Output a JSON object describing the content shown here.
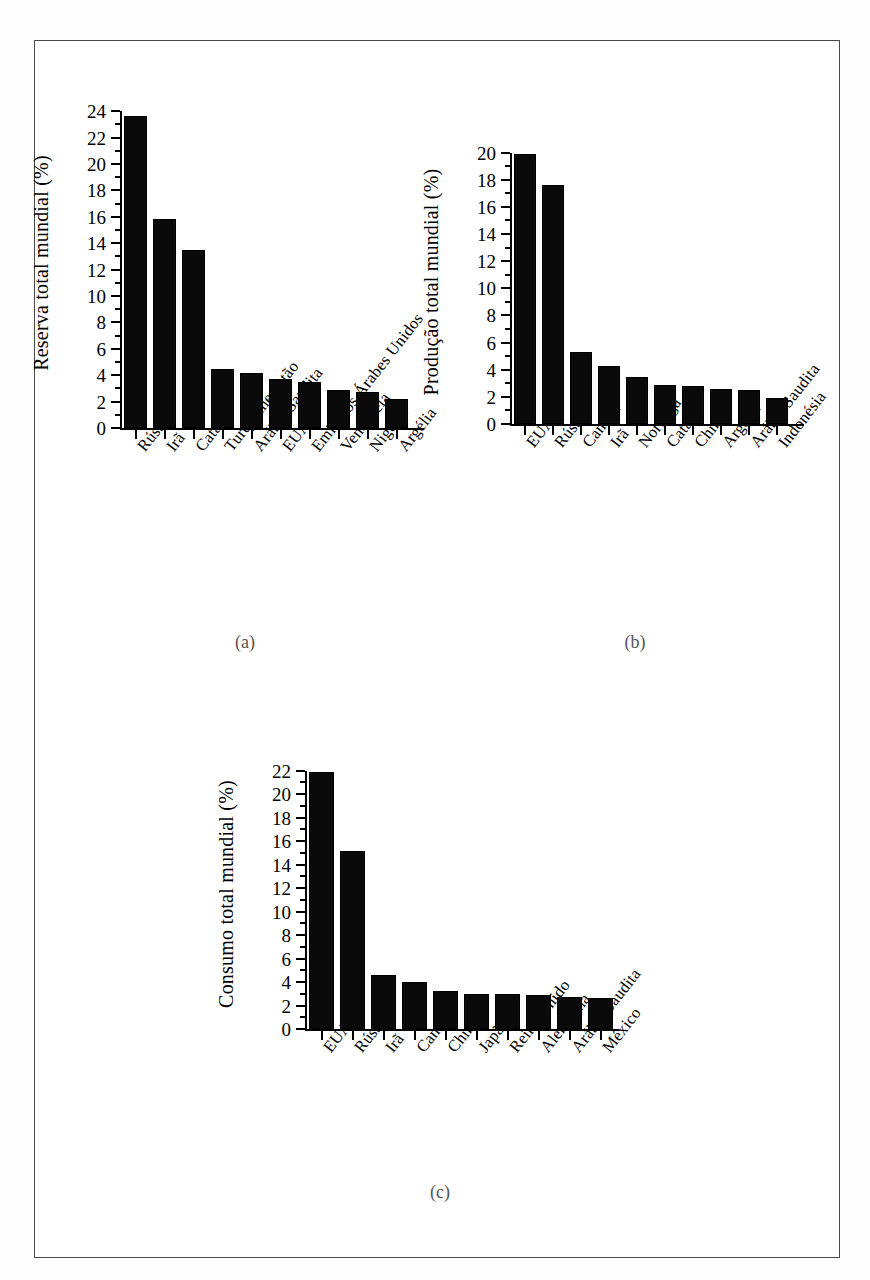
{
  "figure": {
    "captions": [
      {
        "key": "a",
        "label": "(a)"
      },
      {
        "key": "b",
        "label": "(b)"
      },
      {
        "key": "c",
        "label": "(c)"
      }
    ]
  },
  "chart_data": [
    {
      "id": "chart-a",
      "type": "bar",
      "title": "",
      "panel_label": "(a)",
      "xlabel": "",
      "ylabel": "Reserva total mundial (%)",
      "ylim": [
        0,
        25
      ],
      "yticks": [
        0,
        2,
        4,
        6,
        8,
        10,
        12,
        14,
        16,
        18,
        20,
        22,
        24
      ],
      "ytick_labels": [
        "0",
        "2",
        "4",
        "6",
        "8",
        "10",
        "12",
        "14",
        "16",
        "18",
        "20",
        "22",
        "24"
      ],
      "minor_tick_step": 1,
      "grid": false,
      "legend": "none",
      "categories": [
        "Rússia",
        "Irã",
        "Catar",
        "Turquemenistão",
        "Arábia Saudita",
        "EUA",
        "Emirados Árabes Unidos",
        "Venezuela",
        "Nigéria",
        "Argélia"
      ],
      "values": [
        23.6,
        15.8,
        13.5,
        4.5,
        4.2,
        3.7,
        3.5,
        2.9,
        2.7,
        2.2
      ]
    },
    {
      "id": "chart-b",
      "type": "bar",
      "title": "",
      "panel_label": "(b)",
      "xlabel": "",
      "ylabel": "Produção total mundial (%)",
      "ylim": [
        0,
        21
      ],
      "yticks": [
        0,
        2,
        4,
        6,
        8,
        10,
        12,
        14,
        16,
        18,
        20
      ],
      "ytick_labels": [
        "0",
        "2",
        "4",
        "6",
        "8",
        "10",
        "12",
        "14",
        "16",
        "18",
        "20"
      ],
      "minor_tick_step": 1,
      "grid": false,
      "legend": "none",
      "categories": [
        "EUA",
        "Rússia",
        "Canadá",
        "Irã",
        "Noruega",
        "Catar",
        "China",
        "Argélia",
        "Arábia Saudita",
        "Indonésia"
      ],
      "values": [
        19.9,
        17.6,
        5.3,
        4.3,
        3.5,
        2.9,
        2.8,
        2.6,
        2.5,
        1.9
      ]
    },
    {
      "id": "chart-c",
      "type": "bar",
      "title": "",
      "panel_label": "(c)",
      "xlabel": "",
      "ylabel": "Consumo total mundial (%)",
      "ylim": [
        0,
        23
      ],
      "yticks": [
        0,
        2,
        4,
        6,
        8,
        10,
        12,
        14,
        16,
        18,
        20,
        22
      ],
      "ytick_labels": [
        "0",
        "2",
        "4",
        "6",
        "8",
        "10",
        "12",
        "14",
        "16",
        "18",
        "20",
        "22"
      ],
      "minor_tick_step": 1,
      "grid": false,
      "legend": "none",
      "categories": [
        "EUA",
        "Rússia",
        "Irã",
        "Canadá",
        "China",
        "Japão",
        "Reino Unido",
        "Alemanha",
        "Arábia Saudita",
        "México"
      ],
      "values": [
        21.9,
        15.2,
        4.6,
        4.0,
        3.2,
        3.0,
        3.0,
        2.9,
        2.7,
        2.6
      ]
    }
  ]
}
